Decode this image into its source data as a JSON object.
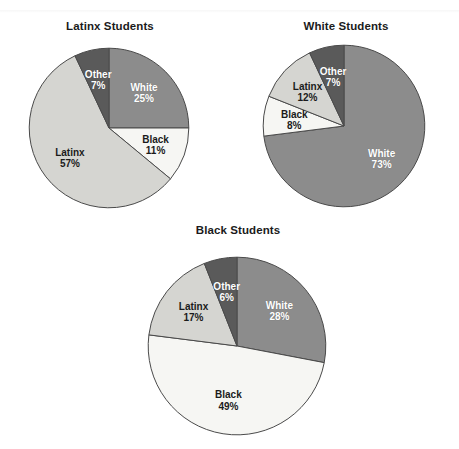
{
  "figure": {
    "background_color": "#ffffff",
    "palette": {
      "White": "#8c8c8c",
      "Black": "#f6f6f3",
      "Latinx": "#d5d5d1",
      "Other": "#5a5a5a",
      "outline": "#4a4a4a",
      "title_color": "#1b1b1b"
    }
  },
  "chart_data": [
    {
      "type": "pie",
      "title": "Latinx Students",
      "labels": [
        "White",
        "Black",
        "Latinx",
        "Other"
      ],
      "values": [
        25,
        11,
        57,
        7
      ],
      "value_labels": [
        "25%",
        "11%",
        "57%",
        "7%"
      ],
      "colors": [
        "#8c8c8c",
        "#f6f6f3",
        "#d5d5d1",
        "#5a5a5a"
      ],
      "label_text_colors": [
        "light",
        "dark",
        "dark",
        "light"
      ],
      "start_angle_deg": 0,
      "direction": "clockwise",
      "legend": "none",
      "slices": [
        {
          "name": "White",
          "label": "White",
          "pct_label": "25%",
          "value": 25,
          "color": "#8c8c8c",
          "text": "light"
        },
        {
          "name": "Black",
          "label": "Black",
          "pct_label": "11%",
          "value": 11,
          "color": "#f6f6f3",
          "text": "dark"
        },
        {
          "name": "Latinx",
          "label": "Latinx",
          "pct_label": "57%",
          "value": 57,
          "color": "#d5d5d1",
          "text": "dark"
        },
        {
          "name": "Other",
          "label": "Other",
          "pct_label": "7%",
          "value": 7,
          "color": "#5a5a5a",
          "text": "light"
        }
      ]
    },
    {
      "type": "pie",
      "title": "White Students",
      "labels": [
        "White",
        "Black",
        "Latinx",
        "Other"
      ],
      "values": [
        73,
        8,
        12,
        7
      ],
      "value_labels": [
        "73%",
        "8%",
        "12%",
        "7%"
      ],
      "colors": [
        "#8c8c8c",
        "#f6f6f3",
        "#d5d5d1",
        "#5a5a5a"
      ],
      "label_text_colors": [
        "light",
        "dark",
        "dark",
        "light"
      ],
      "start_angle_deg": 0,
      "direction": "clockwise",
      "legend": "none",
      "slices": [
        {
          "name": "White",
          "label": "White",
          "pct_label": "73%",
          "value": 73,
          "color": "#8c8c8c",
          "text": "light"
        },
        {
          "name": "Black",
          "label": "Black",
          "pct_label": "8%",
          "value": 8,
          "color": "#f6f6f3",
          "text": "dark"
        },
        {
          "name": "Latinx",
          "label": "Latinx",
          "pct_label": "12%",
          "value": 12,
          "color": "#d5d5d1",
          "text": "dark"
        },
        {
          "name": "Other",
          "label": "Other",
          "pct_label": "7%",
          "value": 7,
          "color": "#5a5a5a",
          "text": "light"
        }
      ]
    },
    {
      "type": "pie",
      "title": "Black Students",
      "labels": [
        "White",
        "Black",
        "Latinx",
        "Other"
      ],
      "values": [
        28,
        49,
        17,
        6
      ],
      "value_labels": [
        "28%",
        "49%",
        "17%",
        "6%"
      ],
      "colors": [
        "#8c8c8c",
        "#f6f6f3",
        "#d5d5d1",
        "#5a5a5a"
      ],
      "label_text_colors": [
        "light",
        "dark",
        "dark",
        "light"
      ],
      "start_angle_deg": 0,
      "direction": "clockwise",
      "legend": "none",
      "slices": [
        {
          "name": "White",
          "label": "White",
          "pct_label": "28%",
          "value": 28,
          "color": "#8c8c8c",
          "text": "light"
        },
        {
          "name": "Black",
          "label": "Black",
          "pct_label": "49%",
          "value": 49,
          "color": "#f6f6f3",
          "text": "dark"
        },
        {
          "name": "Latinx",
          "label": "Latinx",
          "pct_label": "17%",
          "value": 17,
          "color": "#d5d5d1",
          "text": "dark"
        },
        {
          "name": "Other",
          "label": "Other",
          "pct_label": "6%",
          "value": 6,
          "color": "#5a5a5a",
          "text": "light"
        }
      ]
    }
  ],
  "layout": {
    "charts": [
      {
        "title_left": 12,
        "title_top": 20,
        "title_width": 196,
        "pie_left": 28,
        "pie_top": 47,
        "pie_size": 162,
        "label_offset": 0.62
      },
      {
        "title_left": 248,
        "title_top": 20,
        "title_width": 196,
        "pie_left": 262,
        "pie_top": 44,
        "pie_size": 164,
        "label_offset": 0.62
      },
      {
        "title_left": 140,
        "title_top": 224,
        "title_width": 196,
        "pie_left": 147,
        "pie_top": 256,
        "pie_size": 180,
        "label_offset": 0.62
      }
    ]
  }
}
